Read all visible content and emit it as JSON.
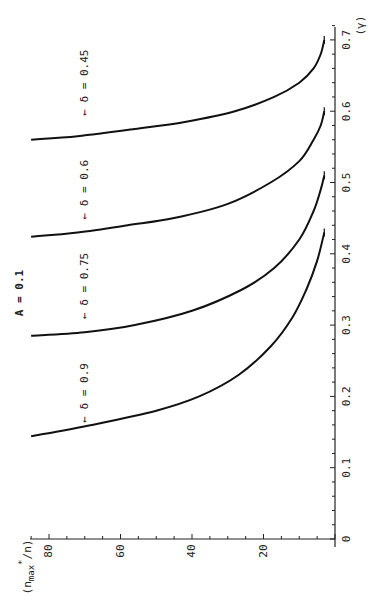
{
  "chart_data": {
    "type": "line",
    "title": "A = 0.1",
    "orientation": "rotated 90° counter-clockwise (x-axis runs bottom-to-top on the right, y-axis runs right-to-left at the bottom)",
    "xlabel": "(γ)",
    "ylabel": "(n*max/n)",
    "xlim": [
      0,
      0.72
    ],
    "ylim": [
      0,
      85
    ],
    "xticks": [
      "0",
      "0.1",
      "0.2",
      "0.3",
      "0.4",
      "0.5",
      "0.6",
      "0.7"
    ],
    "yticks": [
      "20",
      "40",
      "60",
      "80"
    ],
    "grid": false,
    "legend": "inline arrow annotations",
    "series": [
      {
        "name": "δ = 0.9",
        "label": "← δ = 0.9",
        "x": [
          0.144,
          0.16,
          0.18,
          0.2,
          0.23,
          0.27,
          0.31,
          0.35,
          0.39,
          0.43
        ],
        "y": [
          85,
          68,
          50,
          38,
          27,
          18,
          12,
          8,
          5,
          3
        ]
      },
      {
        "name": "δ = 0.75",
        "label": "← δ = 0.75",
        "x": [
          0.285,
          0.29,
          0.3,
          0.32,
          0.35,
          0.38,
          0.42,
          0.46,
          0.49,
          0.51
        ],
        "y": [
          85,
          70,
          56,
          40,
          26,
          17,
          10,
          6,
          4,
          3
        ]
      },
      {
        "name": "δ = 0.6",
        "label": "← δ = 0.6",
        "x": [
          0.424,
          0.43,
          0.44,
          0.45,
          0.47,
          0.5,
          0.53,
          0.56,
          0.58,
          0.6
        ],
        "y": [
          85,
          72,
          58,
          45,
          30,
          18,
          10,
          6,
          4,
          3
        ]
      },
      {
        "name": "δ = 0.45",
        "label": "← δ = 0.45",
        "x": [
          0.56,
          0.565,
          0.575,
          0.585,
          0.6,
          0.62,
          0.64,
          0.66,
          0.68,
          0.7
        ],
        "y": [
          85,
          72,
          56,
          42,
          28,
          17,
          10,
          6,
          4,
          3
        ]
      }
    ],
    "annotations": [
      "A = 0.1"
    ]
  },
  "labels": {
    "title": "A = 0.1",
    "xlabel": "(γ)",
    "ylabel_main": "(n",
    "ylabel_sub": "max",
    "ylabel_sup": "*",
    "ylabel_tail": "/n)",
    "series_labels": [
      "← δ = 0.9",
      "← δ = 0.75",
      "← δ = 0.6",
      "← δ = 0.45"
    ]
  },
  "colors": {
    "line": "#111111",
    "axis": "#222222",
    "background": "#ffffff"
  }
}
